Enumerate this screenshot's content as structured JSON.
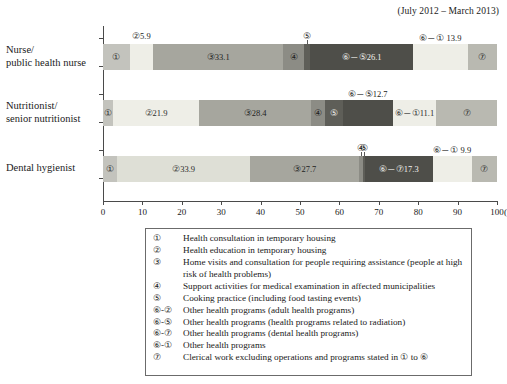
{
  "period_note": "(July 2012 – March 2013)",
  "chart_data": {
    "type": "bar",
    "orientation": "horizontal",
    "stacked": true,
    "title": "",
    "subtitle": "(July 2012 – March 2013)",
    "xlabel": "(%)",
    "ylabel": "",
    "xlim": [
      0,
      100
    ],
    "xticks": [
      0,
      10,
      20,
      30,
      40,
      50,
      60,
      70,
      80,
      90,
      100
    ],
    "xtick_labels": [
      "0",
      "10",
      "20",
      "30",
      "40",
      "50",
      "60",
      "70",
      "80",
      "90",
      "100"
    ],
    "x_unit": "(%)",
    "grid": false,
    "legend_position": "below",
    "categories": [
      "Nurse/\npublic health nurse",
      "Nutritionist/\nsenior nutritionist",
      "Dental hygienist"
    ],
    "category_lines": [
      [
        "Nurse/",
        "public health nurse"
      ],
      [
        "Nutritionist/",
        "senior nutritionist"
      ],
      [
        "Dental hygienist"
      ]
    ],
    "series": [
      {
        "name": "①",
        "key": "①",
        "values": [
          6.8,
          2.5,
          3.5
        ],
        "color": "#c3c3bd"
      },
      {
        "name": "②",
        "key": "②",
        "values": [
          5.9,
          21.9,
          33.9
        ],
        "color": "#eaeae2"
      },
      {
        "name": "③",
        "key": "③",
        "values": [
          33.1,
          28.4,
          27.7
        ],
        "color": "#a6a69e"
      },
      {
        "name": "④",
        "key": "④",
        "values": [
          5.3,
          3.5,
          0.8
        ],
        "color": "#8c8c85"
      },
      {
        "name": "⑤",
        "key": "⑤",
        "values": [
          1.5,
          4.5,
          0.5
        ],
        "color": "#5e5e58"
      },
      {
        "name": "⑥-⑤/⑥-⑦",
        "key": "⑥",
        "values": [
          26.1,
          12.7,
          17.3
        ],
        "color": "#4e4e49"
      },
      {
        "name": "⑥-①",
        "key": "⑥-①",
        "values": [
          13.9,
          11.1,
          9.9
        ],
        "color": "#eaeae2"
      },
      {
        "name": "⑦",
        "key": "⑦",
        "values": [
          7.4,
          15.4,
          6.4
        ],
        "color": "#b9b9b1"
      }
    ],
    "bars": [
      {
        "category": "Nurse/public health nurse",
        "segments": [
          {
            "key": "①",
            "value": 6.8,
            "inside_label": "①",
            "label_pos": "inside",
            "color": "#c3c3bd",
            "text": "#2b2b2b"
          },
          {
            "key": "②",
            "value": 5.9,
            "inside_label": "",
            "callout_label": "②5.9",
            "label_pos": "above",
            "color": "#eeeee7",
            "text": "#2b2b2b"
          },
          {
            "key": "③",
            "value": 33.1,
            "inside_label": "③33.1",
            "label_pos": "inside",
            "color": "#a6a69e",
            "text": "#1f1f1f"
          },
          {
            "key": "④",
            "value": 5.3,
            "inside_label": "④",
            "label_pos": "inside",
            "color": "#8c8c85",
            "text": "#1f1f1f"
          },
          {
            "key": "⑤",
            "value": 1.5,
            "inside_label": "",
            "callout_label": "⑤",
            "label_pos": "above",
            "color": "#5e5e58",
            "text": "#ffffff"
          },
          {
            "key": "⑥-⑤",
            "value": 26.1,
            "inside_label": "⑥－⑤26.1",
            "label_pos": "inside",
            "color": "#4e4e49",
            "text": "#f2f2ee"
          },
          {
            "key": "⑥-①",
            "value": 13.9,
            "inside_label": "",
            "callout_label": "⑥－① 13.9",
            "label_pos": "above",
            "color": "#eeeee7",
            "text": "#2b2b2b"
          },
          {
            "key": "⑦",
            "value": 7.4,
            "inside_label": "⑦",
            "label_pos": "inside",
            "color": "#b9b9b1",
            "text": "#2b2b2b"
          }
        ]
      },
      {
        "category": "Nutritionist/senior nutritionist",
        "segments": [
          {
            "key": "①",
            "value": 2.5,
            "inside_label": "①",
            "label_pos": "inside",
            "color": "#c3c3bd",
            "text": "#2b2b2b"
          },
          {
            "key": "②",
            "value": 21.9,
            "inside_label": "②21.9",
            "label_pos": "inside",
            "color": "#eeeee7",
            "text": "#2b2b2b"
          },
          {
            "key": "③",
            "value": 28.4,
            "inside_label": "③28.4",
            "label_pos": "inside",
            "color": "#a6a69e",
            "text": "#1f1f1f"
          },
          {
            "key": "④",
            "value": 3.5,
            "inside_label": "④",
            "label_pos": "inside",
            "color": "#8c8c85",
            "text": "#1f1f1f"
          },
          {
            "key": "⑤",
            "value": 4.5,
            "inside_label": "⑤",
            "label_pos": "inside",
            "color": "#5e5e58",
            "text": "#f2f2ee"
          },
          {
            "key": "⑥-⑤",
            "value": 12.7,
            "inside_label": "",
            "callout_label": "⑥－⑤12.7",
            "label_pos": "above",
            "color": "#4e4e49",
            "text": "#f2f2ee"
          },
          {
            "key": "⑥-①",
            "value": 11.1,
            "inside_label": "⑥－①11.1",
            "label_pos": "inside",
            "color": "#eeeee7",
            "text": "#2b2b2b"
          },
          {
            "key": "⑦",
            "value": 15.4,
            "inside_label": "⑦",
            "label_pos": "inside",
            "color": "#b9b9b1",
            "text": "#2b2b2b"
          }
        ]
      },
      {
        "category": "Dental hygienist",
        "segments": [
          {
            "key": "①",
            "value": 3.5,
            "inside_label": "①",
            "label_pos": "inside",
            "color": "#c3c3bd",
            "text": "#2b2b2b"
          },
          {
            "key": "②",
            "value": 33.9,
            "inside_label": "②33.9",
            "label_pos": "inside",
            "color": "#dedfd6",
            "text": "#2b2b2b"
          },
          {
            "key": "③",
            "value": 27.7,
            "inside_label": "③27.7",
            "label_pos": "inside",
            "color": "#a6a69e",
            "text": "#1f1f1f"
          },
          {
            "key": "④",
            "value": 0.8,
            "inside_label": "",
            "callout_label": "④",
            "label_pos": "above",
            "color": "#8c8c85",
            "text": "#1f1f1f"
          },
          {
            "key": "⑤",
            "value": 0.5,
            "inside_label": "",
            "callout_label": "⑤",
            "label_pos": "above",
            "color": "#5e5e58",
            "text": "#f2f2ee"
          },
          {
            "key": "⑥-⑦",
            "value": 17.3,
            "inside_label": "⑥－⑦17.3",
            "label_pos": "inside",
            "color": "#4e4e49",
            "text": "#f2f2ee"
          },
          {
            "key": "⑥-①",
            "value": 9.9,
            "inside_label": "",
            "callout_label": "⑥－① 9.9",
            "label_pos": "above",
            "color": "#eeeee7",
            "text": "#2b2b2b"
          },
          {
            "key": "⑦",
            "value": 6.4,
            "inside_label": "⑦",
            "label_pos": "inside",
            "color": "#b9b9b1",
            "text": "#2b2b2b"
          }
        ]
      }
    ]
  },
  "legend": {
    "items": [
      {
        "key": "①",
        "text": "Health consultation in temporary housing"
      },
      {
        "key": "②",
        "text": "Health education in temporary housing"
      },
      {
        "key": "③",
        "text": "Home visits and consultation for people requiring assistance (people at high risk of health problems)"
      },
      {
        "key": "④",
        "text": "Support activities for medical examination in affected municipalities"
      },
      {
        "key": "⑤",
        "text": "Cooking practice (including food tasting events)"
      },
      {
        "key": "⑥-②",
        "text": "Other health programs (adult health programs)"
      },
      {
        "key": "⑥-⑤",
        "text": "Other health programs (health programs related to radiation)"
      },
      {
        "key": "⑥-⑦",
        "text": "Other health programs (dental health programs)"
      },
      {
        "key": "⑥-①",
        "text": "Other health programs"
      },
      {
        "key": "⑦",
        "text": "Clerical work excluding operations and programs stated in ① to ⑥"
      }
    ]
  }
}
